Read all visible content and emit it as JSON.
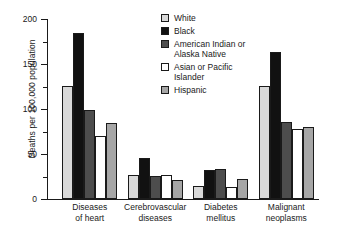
{
  "chart_data": {
    "type": "bar",
    "title": "",
    "subtitle": "",
    "xlabel": "",
    "ylabel": "Deaths per 100,000 population",
    "ylim": [
      0,
      200
    ],
    "yticks": [
      0,
      50,
      100,
      150,
      200
    ],
    "yticks_minor": [
      25,
      75,
      125,
      175
    ],
    "grid": false,
    "legend_position": "top-right",
    "categories": [
      "Diseases of heart",
      "Cerebrovascular diseases",
      "Diabetes mellitus",
      "Malignant neoplasms"
    ],
    "categories_lines": [
      [
        "Diseases",
        "of heart"
      ],
      [
        "Cerebrovascular",
        "diseases"
      ],
      [
        "Diabetes",
        "mellitus"
      ],
      [
        "Malignant",
        "neoplasms"
      ]
    ],
    "series": [
      {
        "name": "White",
        "color": "#d9d9d9",
        "values": [
          126,
          27,
          15,
          126
        ]
      },
      {
        "name": "Black",
        "color": "#111111",
        "values": [
          185,
          46,
          32,
          163
        ]
      },
      {
        "name": "American Indian or Alaska Native",
        "color": "#4d4d4d",
        "values": [
          99,
          26,
          33,
          86
        ]
      },
      {
        "name": "Asian or Pacific Islander",
        "color": "#ffffff",
        "values": [
          70,
          27,
          13,
          78
        ]
      },
      {
        "name": "Hispanic",
        "color": "#a6a6a6",
        "values": [
          85,
          21,
          22,
          80
        ]
      }
    ]
  },
  "legend": {
    "items": [
      {
        "label": "White",
        "color": "#d9d9d9"
      },
      {
        "label": "Black",
        "color": "#111111"
      },
      {
        "label": "American Indian or\nAlaska Native",
        "color": "#4d4d4d"
      },
      {
        "label": "Asian or Pacific\nIslander",
        "color": "#ffffff"
      },
      {
        "label": "Hispanic",
        "color": "#a6a6a6"
      }
    ]
  },
  "axis": {
    "y_title": "Deaths per 100,000 population"
  }
}
